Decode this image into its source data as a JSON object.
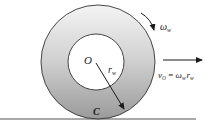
{
  "diagram": {
    "type": "rolling-wheel",
    "colors": {
      "ring_top": "#f4f4f4",
      "ring_bottom": "#9a9a9a",
      "stroke": "#333333",
      "inner_fill": "#ffffff",
      "ground": "#555555"
    },
    "wheel": {
      "outer": {
        "cx": 98,
        "cy": 62,
        "r": 57
      },
      "inner": {
        "cx": 96,
        "cy": 62,
        "r": 28
      }
    },
    "labels": {
      "center": "O",
      "radius_main": "r",
      "radius_sub": "w",
      "contact": "C",
      "omega_main": "ω",
      "omega_sub": "w",
      "velocity_main": "v",
      "velocity_sub": "O",
      "equals": " = ",
      "eq_omega": "ω",
      "eq_omega_sub": "w",
      "eq_r": "r",
      "eq_r_sub": "w"
    }
  }
}
